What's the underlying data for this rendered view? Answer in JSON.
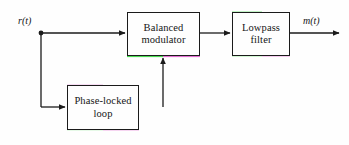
{
  "diagram": {
    "background_color": "#fefefe",
    "line_color": "#1b1b1b",
    "blocks": [
      {
        "id": "balanced-modulator",
        "name": "balanced-modulator-block",
        "label_line1": "Balanced",
        "label_line2": "modulator",
        "x": 127,
        "y": 12,
        "width": 73,
        "height": 44
      },
      {
        "id": "lowpass-filter",
        "name": "lowpass-filter-block",
        "label_line1": "Lowpass",
        "label_line2": "filter",
        "x": 232,
        "y": 12,
        "width": 58,
        "height": 44
      },
      {
        "id": "phase-locked-loop",
        "name": "phase-locked-loop-block",
        "label_line1": "Phase-locked",
        "label_line2": "loop",
        "x": 67,
        "y": 85,
        "width": 72,
        "height": 45
      }
    ],
    "signals": [
      {
        "id": "input-signal",
        "name": "input-signal-label",
        "label": "r(t)",
        "x": 18,
        "y": 15
      },
      {
        "id": "output-signal",
        "name": "output-signal-label",
        "label": "m(t)",
        "x": 303,
        "y": 15
      }
    ],
    "junction": {
      "name": "input-branch-junction",
      "x": 41,
      "y": 33,
      "radius": 2.4
    },
    "colors": {
      "ink": "#1b1b1b",
      "fringe_green": "#41d94a",
      "fringe_magenta": "#d94ac6",
      "fringe_blue": "#3b4fa8",
      "paper": "#fefefe"
    }
  }
}
